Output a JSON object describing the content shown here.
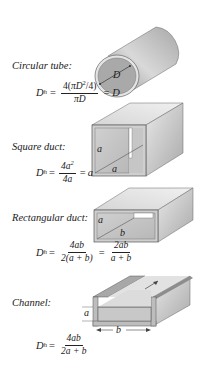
{
  "sections": [
    {
      "shape": "circular-tube",
      "label": "Circular tube:",
      "dimension_labels": [
        "D"
      ],
      "formula": {
        "lhs": "D",
        "lhs_sub": "h",
        "frac1_num_pre": "4(",
        "frac1_num_pi": "π",
        "frac1_num_var": "D",
        "frac1_num_sup": "2",
        "frac1_num_post": "/4)",
        "frac1_den": "πD",
        "result": "D"
      }
    },
    {
      "shape": "square-duct",
      "label": "Square duct:",
      "dimension_labels": [
        "a",
        "a"
      ],
      "formula": {
        "lhs": "D",
        "lhs_sub": "h",
        "frac1_num": "4a",
        "frac1_num_sup": "2",
        "frac1_den": "4a",
        "result": "a"
      }
    },
    {
      "shape": "rectangular-duct",
      "label": "Rectangular duct:",
      "dimension_labels": [
        "a",
        "b"
      ],
      "formula": {
        "lhs": "D",
        "lhs_sub": "h",
        "frac1_num": "4ab",
        "frac1_den": "2(a + b)",
        "frac2_num": "2ab",
        "frac2_den": "a + b"
      }
    },
    {
      "shape": "channel",
      "label": "Channel:",
      "dimension_labels": [
        "a",
        "b"
      ],
      "formula": {
        "lhs": "D",
        "lhs_sub": "h",
        "frac1_num": "4ab",
        "frac1_den": "2a + b"
      }
    }
  ],
  "symbols": {
    "equals": "="
  },
  "colors": {
    "surface_light": "#e6e6e6",
    "surface_mid": "#c4c4c4",
    "surface_dark": "#9a9a9a",
    "outline": "#555555",
    "fluid": "#bdbdbd"
  }
}
